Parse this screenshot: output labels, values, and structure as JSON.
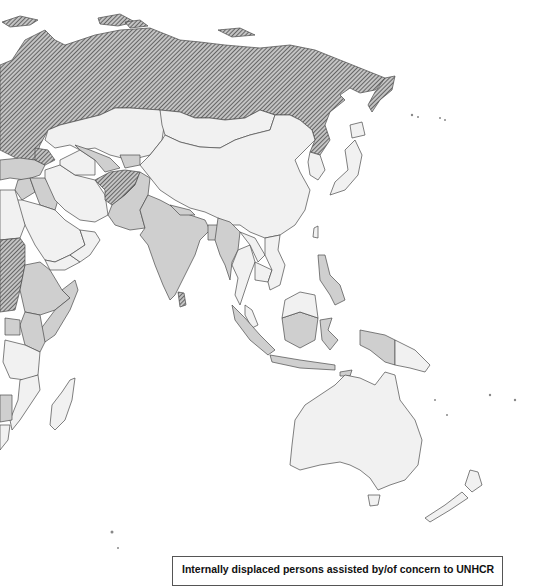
{
  "map": {
    "region": "Asia, Middle East, East Africa and Oceania",
    "ocean_color": "#ffffff",
    "border_color": "#4a4a4a",
    "categories": [
      {
        "id": "hatched",
        "fill": "#b9b9b9",
        "stripe": "#555555",
        "countries": [
          "Russian Federation",
          "Afghanistan",
          "Sri Lanka",
          "Sudan",
          "Georgia",
          "Azerbaijan"
        ]
      },
      {
        "id": "medium",
        "fill": "#cfcfcf",
        "countries": [
          "India",
          "Pakistan",
          "Nepal",
          "Bangladesh",
          "Myanmar",
          "Indonesia",
          "Philippines",
          "Iraq",
          "Syria",
          "Turkey",
          "Ethiopia",
          "Somalia",
          "Kenya",
          "Uganda",
          "Yemen",
          "Uzbekistan",
          "Kyrgyzstan",
          "Tajikistan",
          "Timor-Leste",
          "Zimbabwe"
        ]
      },
      {
        "id": "light",
        "fill": "#f1f1f1",
        "countries": [
          "China",
          "Mongolia",
          "Kazakhstan",
          "Iran",
          "Saudi Arabia",
          "Australia",
          "Thailand",
          "Laos",
          "Cambodia",
          "Vietnam",
          "Malaysia",
          "Papua New Guinea",
          "Japan",
          "Korea",
          "Tanzania",
          "Mozambique",
          "Madagascar",
          "New Zealand",
          "Oman",
          "Turkmenistan"
        ]
      }
    ]
  },
  "legend": {
    "title": "Internally displaced persons assisted by/of concern to UNHCR"
  }
}
